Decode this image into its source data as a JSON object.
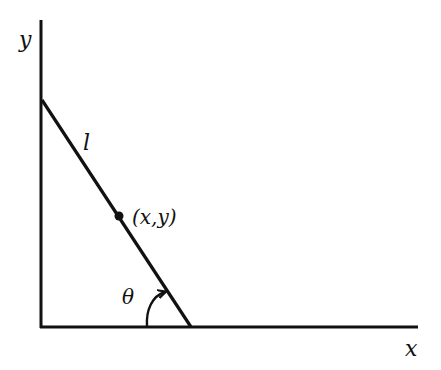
{
  "diagram": {
    "type": "geometry",
    "colors": {
      "stroke": "#111111",
      "background": "#ffffff"
    },
    "axes": {
      "x_label": "x",
      "y_label": "y"
    },
    "segment": {
      "label": "l",
      "top_endpoint": "on y-axis",
      "bottom_endpoint": "on x-axis"
    },
    "point": {
      "label": "(x,y)"
    },
    "angle": {
      "label": "θ",
      "symbol": "theta",
      "arrow": "curved arrow from x-axis toward segment"
    }
  }
}
